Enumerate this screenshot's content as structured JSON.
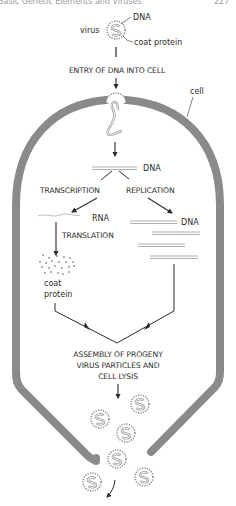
{
  "header": {
    "running_title": "Basic Genetic Elements and Viruses",
    "page_number": "227"
  },
  "diagram": {
    "virus_label": "virus",
    "virus_dna_label": "DNA",
    "virus_coat_label": "coat protein",
    "step_entry": "ENTRY OF DNA INTO CELL",
    "cell_label": "cell",
    "dna_label": "DNA",
    "transcription_label": "TRANSCRIPTION",
    "replication_label": "REPLICATION",
    "rna_label": "RNA",
    "replicated_dna_label": "DNA",
    "translation_label": "TRANSLATION",
    "coat_protein_line1": "coat",
    "coat_protein_line2": "protein",
    "assembly_line1": "ASSEMBLY OF PROGENY",
    "assembly_line2": "VIRUS PARTICLES AND",
    "assembly_line3": "CELL LYSIS"
  },
  "colors": {
    "cell_wall": "#8a8a8a",
    "ink": "#2b2b2b",
    "strand": "#9a9a9a"
  }
}
